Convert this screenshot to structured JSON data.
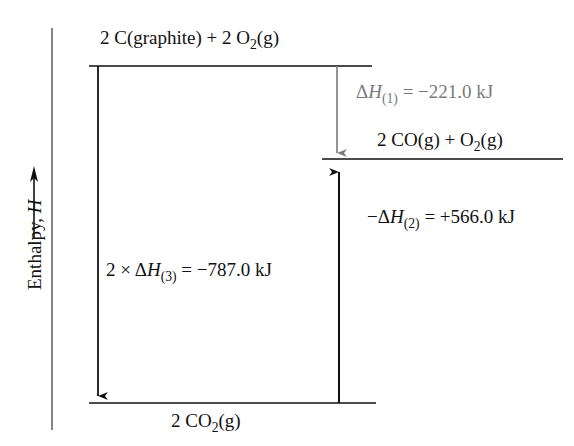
{
  "diagram": {
    "type": "enthalpy-level-diagram",
    "y_axis": {
      "label_prefix": "Enthalpy, ",
      "label_symbol": "H",
      "direction": "up"
    },
    "levels": [
      {
        "id": "reactants",
        "prefix": "2 C(graphite) + 2 O",
        "sub": "2",
        "suffix": "(g)"
      },
      {
        "id": "intermediate",
        "prefix": "2 CO(g) + O",
        "sub": "2",
        "suffix": "(g)"
      },
      {
        "id": "products",
        "prefix": "2 CO",
        "sub": "2",
        "suffix": "(g)"
      }
    ],
    "arrows": [
      {
        "id": "dh1",
        "from": "reactants",
        "to": "intermediate",
        "lhs_prefix": "Δ",
        "lhs_symbol": "H",
        "lhs_sub": "(1)",
        "rhs": "= −221.0 kJ",
        "color": "#7a7a7a"
      },
      {
        "id": "dh2",
        "from": "products",
        "to": "intermediate",
        "lhs_prefix": "−Δ",
        "lhs_symbol": "H",
        "lhs_sub": "(2)",
        "rhs": "= +566.0 kJ",
        "color": "#111111"
      },
      {
        "id": "dh3",
        "from": "reactants",
        "to": "products",
        "lhs_prefix": "2 × Δ",
        "lhs_symbol": "H",
        "lhs_sub": "(3)",
        "rhs": "= −787.0 kJ",
        "color": "#111111"
      }
    ]
  }
}
